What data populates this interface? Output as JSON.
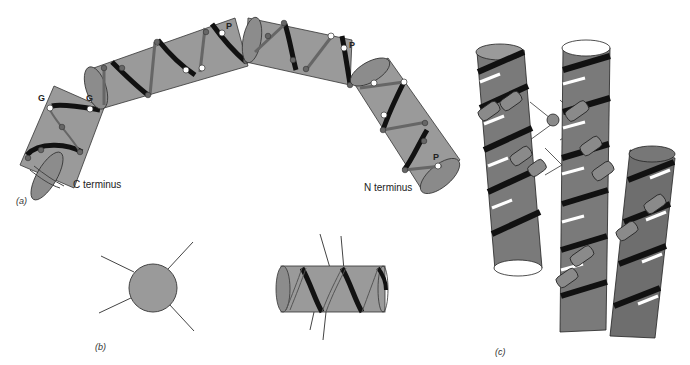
{
  "figure": {
    "panels": [
      {
        "id": "a",
        "label": "(a)"
      },
      {
        "id": "b",
        "label": "(b)"
      },
      {
        "id": "c",
        "label": "(c)"
      }
    ],
    "panel_a": {
      "c_terminus_label": "C terminus",
      "n_terminus_label": "N terminus",
      "residue_labels": [
        {
          "text": "G"
        },
        {
          "text": "G"
        },
        {
          "text": "P"
        },
        {
          "text": "P"
        },
        {
          "text": "P"
        }
      ]
    },
    "colors": {
      "cylinder_fill": "#9a9a9a",
      "cylinder_dark": "#6e6e6e",
      "helix_stripe": "#111111",
      "outline": "#333333",
      "white_dot": "#ffffff",
      "dark_dot": "#555555"
    }
  }
}
